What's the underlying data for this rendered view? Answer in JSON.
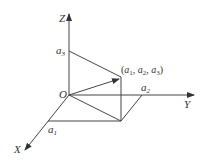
{
  "diagram": {
    "type": "3d-coordinate-axes",
    "axes": {
      "x_label": "X",
      "y_label": "Y",
      "z_label": "Z",
      "origin_label": "O"
    },
    "ticks": {
      "a1": {
        "base": "a",
        "sub": "1"
      },
      "a2": {
        "base": "a",
        "sub": "2"
      },
      "a3": {
        "base": "a",
        "sub": "3"
      }
    },
    "point": {
      "label_open": "(",
      "c1": "a",
      "s1": "1",
      "c2": "a",
      "s2": "2",
      "c3": "a",
      "s3": "3",
      "label_close": ")",
      "sep": ", "
    },
    "colors": {
      "line": "#444444",
      "text": "#333333",
      "background": "#ffffff"
    }
  }
}
